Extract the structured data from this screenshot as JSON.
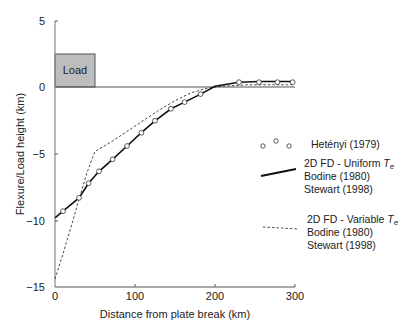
{
  "chart_data": {
    "type": "line",
    "title": "",
    "xlabel": "Distance from plate break (km)",
    "ylabel": "Flexure/Load height (km)",
    "xlim": [
      0,
      300
    ],
    "ylim": [
      -15,
      5
    ],
    "xticks": [
      0,
      100,
      200,
      300
    ],
    "yticks": [
      5,
      0,
      -5,
      -10,
      -15
    ],
    "xtick_labels": [
      "0",
      "100",
      "200",
      "300"
    ],
    "ytick_labels": [
      "5",
      "0",
      "−5",
      "−10",
      "−15"
    ],
    "grid": false,
    "annotations": [
      {
        "text": "Load",
        "type": "box",
        "x_range": [
          0,
          50
        ],
        "y_range": [
          0,
          2.5
        ],
        "fill": "#bdbdbd"
      }
    ],
    "series": [
      {
        "name": "Hetényi (1979)",
        "style": "markers-open-circle",
        "x": [
          10,
          30,
          42,
          55,
          72,
          90,
          108,
          125,
          145,
          162,
          182,
          230,
          255,
          278,
          297
        ],
        "y": [
          -9.3,
          -8.3,
          -7.2,
          -6.3,
          -5.4,
          -4.4,
          -3.4,
          -2.5,
          -1.6,
          -1.1,
          -0.5,
          0.4,
          0.4,
          0.4,
          0.4
        ]
      },
      {
        "name": "2D FD - Uniform Te / Bodine (1980) / Stewart (1998)",
        "style": "solid",
        "x": [
          0,
          10,
          30,
          42,
          55,
          72,
          90,
          108,
          125,
          145,
          162,
          182,
          200,
          230,
          255,
          278,
          297
        ],
        "y": [
          -9.8,
          -9.3,
          -8.3,
          -7.2,
          -6.3,
          -5.4,
          -4.4,
          -3.4,
          -2.5,
          -1.6,
          -1.1,
          -0.5,
          0.1,
          0.4,
          0.45,
          0.45,
          0.45
        ]
      },
      {
        "name": "2D FD - Variable Te / Bodine (1980) / Stewart (1998)",
        "style": "dashed",
        "x": [
          0,
          10,
          20,
          30,
          40,
          50,
          70,
          90,
          110,
          130,
          150,
          170,
          190,
          210,
          240,
          270,
          297
        ],
        "y": [
          -14.4,
          -12.5,
          -10.5,
          -8.4,
          -6.4,
          -4.8,
          -4.1,
          -3.3,
          -2.5,
          -1.7,
          -1.0,
          -0.4,
          -0.05,
          0.1,
          0.2,
          0.2,
          0.2
        ]
      }
    ],
    "legend": {
      "position": "right-middle",
      "entries": [
        {
          "symbol": "markers",
          "lines": [
            "Hetényi (1979)"
          ]
        },
        {
          "symbol": "solid",
          "lines": [
            "2D FD - Uniform Te",
            "Bodine (1980)",
            "Stewart (1998)"
          ]
        },
        {
          "symbol": "dashed",
          "lines": [
            "2D FD - Variable Te",
            "Bodine (1980)",
            "Stewart (1998)"
          ]
        }
      ]
    }
  },
  "labels": {
    "xlabel": "Distance from plate break (km)",
    "ylabel": "Flexure/Load height (km)",
    "load": "Load",
    "x0": "0",
    "x100": "100",
    "x200": "200",
    "x300": "300",
    "y5": "5",
    "y0": "0",
    "ym5": "−5",
    "ym10": "−10",
    "ym15": "−15",
    "leg1": "Hetényi (1979)",
    "leg2a": "2D FD - Uniform ",
    "leg2b": "Bodine (1980)",
    "leg2c": "Stewart (1998)",
    "leg3a": "2D FD - Variable ",
    "leg3b": "Bodine (1980)",
    "leg3c": "Stewart (1998)",
    "te": "T",
    "te_sub": "e"
  },
  "colors": {
    "load_fill": "#bdbdbd",
    "axis": "#555555",
    "line": "#111111"
  }
}
